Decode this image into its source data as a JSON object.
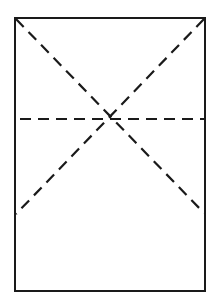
{
  "diagram": {
    "colors": {
      "background": "#ffffff",
      "stroke": "#1a1a1a"
    },
    "rectangle": {
      "x": 15,
      "y": 18,
      "width": 190,
      "height": 273
    },
    "dashed_lines": [
      {
        "name": "diagonal-top-left-to-right-edge",
        "x1": 16,
        "y1": 19,
        "x2": 204,
        "y2": 213
      },
      {
        "name": "diagonal-top-right-to-left-edge",
        "x1": 204,
        "y1": 19,
        "x2": 16,
        "y2": 214
      },
      {
        "name": "horizontal-through-intersection",
        "x1": 20,
        "y1": 119,
        "x2": 204,
        "y2": 119
      }
    ],
    "intersection": {
      "x": 113,
      "y": 119
    }
  }
}
